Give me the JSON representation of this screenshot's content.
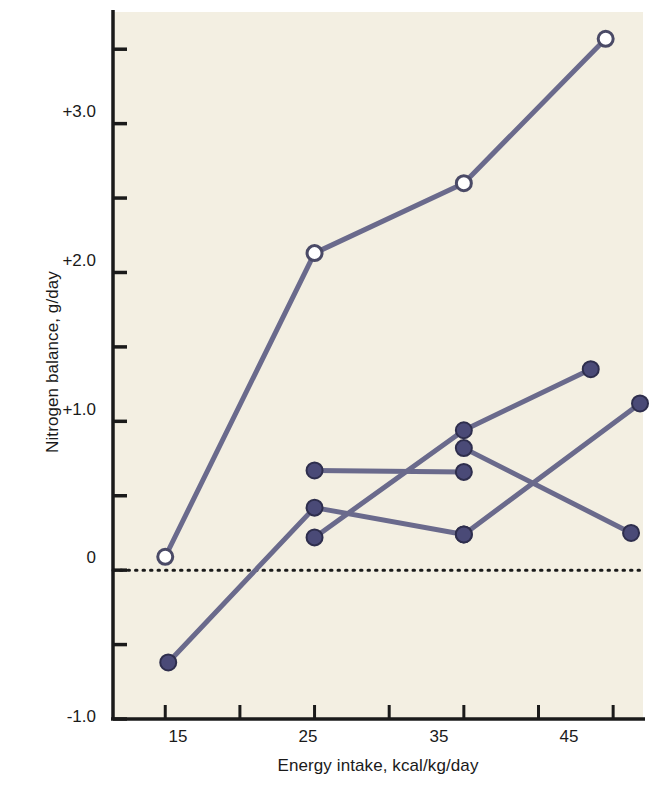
{
  "chart_data": {
    "type": "line",
    "title": "",
    "subtitle": "",
    "xlabel": "Energy intake, kcal/kg/day",
    "ylabel": "Nitrogen balance, g/day",
    "xlim": [
      11.5,
      47.0
    ],
    "ylim": [
      -1.0,
      3.75
    ],
    "xticks": [
      15,
      20,
      25,
      30,
      35,
      40,
      45
    ],
    "xtick_labels": [
      "15",
      "",
      "25",
      "",
      "35",
      "",
      "45"
    ],
    "yticks": [
      -1.0,
      -0.5,
      0,
      0.5,
      1.0,
      1.5,
      2.0,
      2.5,
      3.0,
      3.5
    ],
    "ytick_labels": [
      "-1.0",
      "",
      "0",
      "",
      "+1.0",
      "",
      "+2.0",
      "",
      "+3.0",
      ""
    ],
    "grid": false,
    "legend": "none",
    "zero_reference_line": {
      "y": 0,
      "style": "dotted"
    },
    "marker_styles": {
      "open": {
        "fill": "#ffffff",
        "stroke": "#4a4a66",
        "shape": "circle"
      },
      "filled": {
        "fill": "#4a4a77",
        "stroke": "#2e2e4d",
        "shape": "circle"
      }
    },
    "line_color": "#6a6a8c",
    "plot_background": "#f3efe2",
    "series": [
      {
        "name": "Series A",
        "marker": "open",
        "x": [
          15.0,
          25.0,
          35.0,
          44.5
        ],
        "y": [
          0.09,
          2.13,
          2.6,
          3.57
        ]
      },
      {
        "name": "Series B",
        "marker": "filled",
        "x": [
          15.2,
          25.0,
          35.0
        ],
        "y": [
          -0.62,
          0.42,
          0.24
        ]
      },
      {
        "name": "Series C",
        "marker": "filled",
        "x": [
          25.0,
          35.0
        ],
        "y": [
          0.67,
          0.66
        ]
      },
      {
        "name": "Series D",
        "marker": "filled",
        "x": [
          25.0,
          35.0,
          43.5
        ],
        "y": [
          0.22,
          0.94,
          1.35
        ]
      },
      {
        "name": "Series E",
        "marker": "filled",
        "x": [
          35.0,
          46.2
        ],
        "y": [
          0.82,
          0.25
        ]
      },
      {
        "name": "Series F",
        "marker": "filled",
        "x": [
          35.0,
          46.8
        ],
        "y": [
          0.24,
          1.12
        ]
      }
    ]
  },
  "axes": {
    "y_title": "Nitrogen balance, g/day",
    "x_title": "Energy intake, kcal/kg/day",
    "y_tick_labels": [
      "+3.0",
      "+2.0",
      "+1.0",
      "0",
      "-1.0"
    ],
    "x_tick_labels": [
      "15",
      "25",
      "35",
      "45"
    ]
  }
}
